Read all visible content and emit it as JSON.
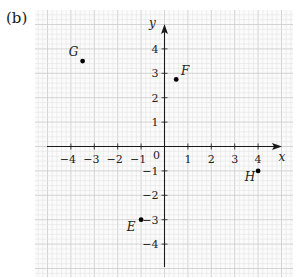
{
  "panel_label": "(b)",
  "chart_data": {
    "type": "scatter",
    "title": "",
    "xlabel": "x",
    "ylabel": "y",
    "xlim": [
      -4.9,
      4.8
    ],
    "ylim": [
      -5.4,
      5.5
    ],
    "grid": true,
    "grid_minor_step": 0.2,
    "x_ticks": [
      -4,
      -3,
      -2,
      -1,
      1,
      2,
      3,
      4
    ],
    "y_ticks": [
      -4,
      -3,
      -2,
      -1,
      1,
      2,
      3,
      4
    ],
    "origin_label": "0",
    "points": [
      {
        "label": "G",
        "x": -3.5,
        "y": 3.5
      },
      {
        "label": "F",
        "x": 0.5,
        "y": 2.75
      },
      {
        "label": "E",
        "x": -1,
        "y": -3
      },
      {
        "label": "H",
        "x": 4,
        "y": -1
      }
    ]
  },
  "colors": {
    "minor_grid": "#e4e4e4",
    "major_grid": "#cfcfcf",
    "axis": "#1a1a1a",
    "point": "#000000"
  }
}
